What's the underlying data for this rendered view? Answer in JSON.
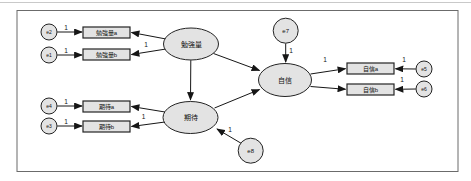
{
  "diagram": {
    "type": "sem-path-diagram",
    "canvas": {
      "width": 471,
      "height": 181
    },
    "colors": {
      "background": "#ffffff",
      "frame": "#6b6b6b",
      "scan_edge": "#c9c9c9",
      "node_fill": "#e3e3e3",
      "node_stroke": "#232323",
      "edge": "#161616",
      "text": "#111111"
    },
    "frame": {
      "x": 17,
      "y": 10.5,
      "w": 441,
      "h": 161
    },
    "latent_nodes": [
      {
        "id": "study-amount",
        "label": "勉強量",
        "cx": 191,
        "cy": 44,
        "rx": 27.5,
        "ry": 16
      },
      {
        "id": "expectation",
        "label": "期待",
        "cx": 190.5,
        "cy": 117.5,
        "rx": 27.5,
        "ry": 16
      },
      {
        "id": "confidence",
        "label": "自信",
        "cx": 285,
        "cy": 80,
        "rx": 26.5,
        "ry": 16.5
      }
    ],
    "observed_nodes": [
      {
        "id": "study-amount-a",
        "label": "勉強量a",
        "x": 83,
        "y": 27,
        "w": 47,
        "h": 11
      },
      {
        "id": "study-amount-b",
        "label": "勉強量b",
        "x": 83,
        "y": 49,
        "w": 47,
        "h": 11
      },
      {
        "id": "expectation-a",
        "label": "期待a",
        "x": 83,
        "y": 101,
        "w": 47,
        "h": 11
      },
      {
        "id": "expectation-b",
        "label": "期待b",
        "x": 83,
        "y": 121,
        "w": 47,
        "h": 11
      },
      {
        "id": "confidence-a",
        "label": "自信a",
        "x": 347,
        "y": 63,
        "w": 47,
        "h": 11
      },
      {
        "id": "confidence-b",
        "label": "自信b",
        "x": 347,
        "y": 84,
        "w": 47,
        "h": 11
      }
    ],
    "error_nodes": [
      {
        "id": "e2",
        "label": "e2",
        "cx": 49,
        "cy": 32,
        "r": 8
      },
      {
        "id": "e1",
        "label": "e1",
        "cx": 49,
        "cy": 55,
        "r": 8
      },
      {
        "id": "e4",
        "label": "e4",
        "cx": 49,
        "cy": 106,
        "r": 8
      },
      {
        "id": "e3",
        "label": "e3",
        "cx": 49,
        "cy": 126,
        "r": 8
      },
      {
        "id": "e7",
        "label": "e7",
        "cx": 285.7,
        "cy": 30.7,
        "r": 12.5
      },
      {
        "id": "e8",
        "label": "e8",
        "cx": 250.7,
        "cy": 150.7,
        "r": 12.5
      },
      {
        "id": "e5",
        "label": "e5",
        "cx": 424,
        "cy": 69,
        "r": 8
      },
      {
        "id": "e6",
        "label": "e6",
        "cx": 424,
        "cy": 89,
        "r": 8
      }
    ],
    "edges": [
      {
        "from": "e2",
        "to": "study-amount-a",
        "x1": 57.2,
        "y1": 32,
        "x2": 82,
        "y2": 32,
        "label": "1",
        "lx": 66,
        "ly": 29.5
      },
      {
        "from": "e1",
        "to": "study-amount-b",
        "x1": 57.2,
        "y1": 55,
        "x2": 82,
        "y2": 55,
        "label": "1",
        "lx": 66,
        "ly": 52.5
      },
      {
        "from": "e4",
        "to": "expectation-a",
        "x1": 57.2,
        "y1": 106,
        "x2": 82,
        "y2": 106,
        "label": "1",
        "lx": 66,
        "ly": 103.5
      },
      {
        "from": "e3",
        "to": "expectation-b",
        "x1": 57.2,
        "y1": 126,
        "x2": 82,
        "y2": 126,
        "label": "1",
        "lx": 66,
        "ly": 123.5
      },
      {
        "from": "study-amount",
        "to": "study-amount-a",
        "x1": 166,
        "y1": 39,
        "x2": 131.5,
        "y2": 32.5
      },
      {
        "from": "study-amount",
        "to": "study-amount-b",
        "x1": 166,
        "y1": 49,
        "x2": 131.5,
        "y2": 54.5,
        "label": "1",
        "lx": 146,
        "ly": 47
      },
      {
        "from": "expectation",
        "to": "expectation-a",
        "x1": 165,
        "y1": 112,
        "x2": 131.5,
        "y2": 106.5
      },
      {
        "from": "expectation",
        "to": "expectation-b",
        "x1": 165,
        "y1": 122,
        "x2": 131.5,
        "y2": 126.5,
        "label": "1",
        "lx": 143.5,
        "ly": 118.5
      },
      {
        "from": "study-amount",
        "to": "expectation",
        "x1": 190.8,
        "y1": 60.2,
        "x2": 190.5,
        "y2": 100
      },
      {
        "from": "study-amount",
        "to": "confidence",
        "x1": 213.5,
        "y1": 53.5,
        "x2": 259.5,
        "y2": 70.5
      },
      {
        "from": "expectation",
        "to": "confidence",
        "x1": 214.5,
        "y1": 108,
        "x2": 259.5,
        "y2": 89.5
      },
      {
        "from": "e7",
        "to": "confidence",
        "x1": 285.7,
        "y1": 43.4,
        "x2": 285.7,
        "y2": 62,
        "label": "1",
        "lx": 291,
        "ly": 53
      },
      {
        "from": "e8",
        "to": "expectation",
        "x1": 241.5,
        "y1": 143.5,
        "x2": 217,
        "y2": 129,
        "label": "1",
        "lx": 230,
        "ly": 131.5
      },
      {
        "from": "confidence",
        "to": "confidence-a",
        "x1": 310.5,
        "y1": 74,
        "x2": 345.5,
        "y2": 68.7,
        "label": "1",
        "lx": 325,
        "ly": 62
      },
      {
        "from": "confidence",
        "to": "confidence-b",
        "x1": 310.5,
        "y1": 86.5,
        "x2": 345.5,
        "y2": 89.3
      },
      {
        "from": "e5",
        "to": "confidence-a",
        "x1": 415.8,
        "y1": 69,
        "x2": 395.5,
        "y2": 68.8,
        "label": "1",
        "lx": 404,
        "ly": 61.5
      },
      {
        "from": "e6",
        "to": "confidence-b",
        "x1": 415.8,
        "y1": 89,
        "x2": 395.5,
        "y2": 89.3,
        "label": "1",
        "lx": 402,
        "ly": 82
      }
    ]
  }
}
